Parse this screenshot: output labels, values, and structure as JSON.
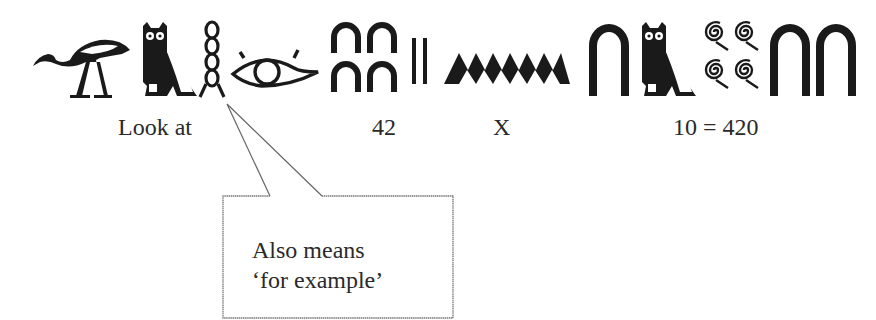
{
  "diagram": {
    "glyph_groups": [
      {
        "id": "look-at",
        "glyphs": [
          "ibis-icon",
          "owl-icon",
          "twisted-flax-icon",
          "eye-icon"
        ],
        "label": "Look at"
      },
      {
        "id": "forty-two",
        "glyphs": [
          "heel-bone-ten-icon",
          "heel-bone-ten-icon",
          "heel-bone-ten-icon",
          "heel-bone-ten-icon",
          "stroke-one-icon",
          "stroke-one-icon"
        ],
        "label": "42"
      },
      {
        "id": "times",
        "glyphs": [
          "water-ripple-icon"
        ],
        "label": "X"
      },
      {
        "id": "ten-equals-420",
        "glyphs": [
          "heel-bone-ten-icon",
          "owl-icon",
          "coil-hundred-icon",
          "coil-hundred-icon",
          "coil-hundred-icon",
          "coil-hundred-icon",
          "heel-bone-ten-icon",
          "heel-bone-ten-icon"
        ],
        "label": "10 = 420"
      }
    ],
    "labels": {
      "look_at": "Look at",
      "forty_two": "42",
      "times": "X",
      "result": "10 = 420"
    },
    "callout": {
      "points_to": "twisted-flax-icon",
      "line1": "Also means",
      "line2": "‘for example’"
    },
    "colors": {
      "ink": "#1a1a1a",
      "text": "#2a2a2a",
      "callout_border": "#777777",
      "background": "#ffffff"
    }
  }
}
